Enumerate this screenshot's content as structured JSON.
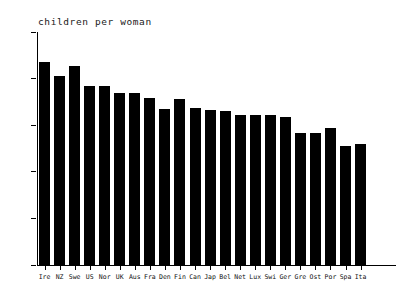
{
  "chart_data": {
    "type": "bar",
    "title": "children per woman",
    "xlabel": "",
    "ylabel": "",
    "ylim": [
      0,
      2.5
    ],
    "yticks": [
      "0",
      "0.5",
      "1",
      "1.5",
      "2",
      "2.5"
    ],
    "ytick_values": [
      0,
      0.5,
      1,
      1.5,
      2,
      2.5
    ],
    "grid": false,
    "legend": "none",
    "bar_color": "#000000",
    "categories": [
      "Ire",
      "NZ",
      "Swe",
      "US",
      "Nor",
      "UK",
      "Aus",
      "Fra",
      "Den",
      "Fin",
      "Can",
      "Jap",
      "Bel",
      "Net",
      "Lux",
      "Swi",
      "Ger",
      "Gre",
      "Ost",
      "Por",
      "Spa",
      "Ita"
    ],
    "values": [
      2.18,
      2.03,
      2.14,
      1.92,
      1.92,
      1.85,
      1.85,
      1.79,
      1.67,
      1.78,
      1.68,
      1.66,
      1.65,
      1.61,
      1.61,
      1.61,
      1.59,
      1.42,
      1.42,
      1.47,
      1.28,
      1.3
    ]
  }
}
